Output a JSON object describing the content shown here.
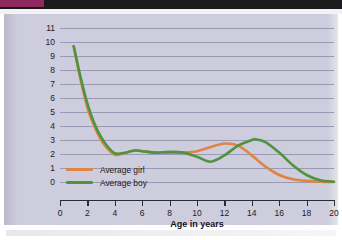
{
  "chart_data": {
    "type": "line",
    "title": "",
    "xlabel": "Age in years",
    "ylabel": "Height gain in inches per year",
    "xlim": [
      0,
      20
    ],
    "ylim": [
      0,
      11
    ],
    "xticks": [
      0,
      2,
      4,
      6,
      8,
      10,
      12,
      14,
      16,
      18,
      20
    ],
    "yticks": [
      0,
      1,
      2,
      3,
      4,
      5,
      6,
      7,
      8,
      9,
      10,
      11
    ],
    "grid": "horizontal",
    "legend_position": "inside-lower-left",
    "series": [
      {
        "name": "Average girl",
        "color": "#df8445",
        "x": [
          1,
          1.5,
          2,
          2.5,
          3,
          3.5,
          4,
          4.5,
          5,
          5.5,
          6,
          7,
          8,
          9,
          10,
          11,
          12,
          13,
          14,
          15,
          16,
          17,
          18,
          19,
          20
        ],
        "values": [
          9.7,
          7.3,
          5.3,
          4.0,
          3.0,
          2.35,
          1.95,
          2.0,
          2.15,
          2.25,
          2.2,
          2.1,
          2.1,
          2.1,
          2.2,
          2.5,
          2.75,
          2.6,
          1.9,
          1.1,
          0.5,
          0.2,
          0.08,
          0.03,
          0.0
        ]
      },
      {
        "name": "Average boy",
        "color": "#4f9340",
        "x": [
          1,
          1.5,
          2,
          2.5,
          3,
          3.5,
          4,
          4.5,
          5,
          5.5,
          6,
          7,
          8,
          9,
          10,
          11,
          12,
          13,
          14,
          14.3,
          15,
          16,
          17,
          18,
          19,
          20
        ],
        "values": [
          9.7,
          7.5,
          5.6,
          4.2,
          3.2,
          2.5,
          2.05,
          2.05,
          2.15,
          2.25,
          2.2,
          2.1,
          2.15,
          2.1,
          1.8,
          1.45,
          1.9,
          2.6,
          3.0,
          3.05,
          2.85,
          2.1,
          1.2,
          0.5,
          0.12,
          0.02
        ]
      }
    ]
  },
  "legend": {
    "items": [
      {
        "label": "Average girl",
        "color": "#df8445"
      },
      {
        "label": "Average boy",
        "color": "#4f9340"
      }
    ]
  },
  "colors": {
    "panel_background": "#cdcddd",
    "gridline": "#9a9ab4",
    "axis": "#2b2b33",
    "text": "#14141c",
    "scan_band": "#1b1a1c",
    "scan_accent": "#8e2a5e"
  }
}
